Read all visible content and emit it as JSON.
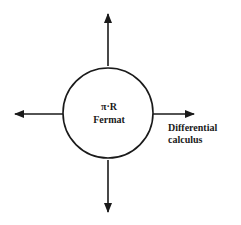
{
  "diagram": {
    "center_node": {
      "symbol_line": "π·R",
      "name_line": "Fermat"
    },
    "arrows": [
      {
        "direction": "up",
        "label": ""
      },
      {
        "direction": "down",
        "label": ""
      },
      {
        "direction": "left",
        "label": ""
      },
      {
        "direction": "right",
        "label_line1": "Differential",
        "label_line2": "calculus"
      }
    ],
    "colors": {
      "stroke": "#1a1a1a",
      "background": "#ffffff"
    }
  }
}
